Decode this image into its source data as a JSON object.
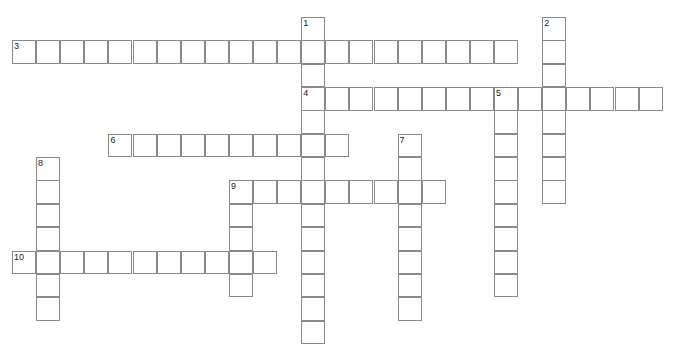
{
  "puzzle": {
    "type": "crossword",
    "cell_w": 24.1,
    "cell_h": 23.35,
    "origin_x": 12,
    "origin_y": 17,
    "line_color": "#8a8a8a",
    "words": [
      {
        "number": "1",
        "direction": "down",
        "row": 0,
        "col": 12,
        "length": 14
      },
      {
        "number": "2",
        "direction": "down",
        "row": 0,
        "col": 22,
        "length": 8
      },
      {
        "number": "3",
        "direction": "across",
        "row": 1,
        "col": 0,
        "length": 21
      },
      {
        "number": "4",
        "direction": "across",
        "row": 3,
        "col": 12,
        "length": 15
      },
      {
        "number": "5",
        "direction": "down",
        "row": 3,
        "col": 20,
        "length": 9
      },
      {
        "number": "6",
        "direction": "across",
        "row": 5,
        "col": 4,
        "length": 10
      },
      {
        "number": "7",
        "direction": "down",
        "row": 5,
        "col": 16,
        "length": 8
      },
      {
        "number": "8",
        "direction": "down",
        "row": 6,
        "col": 1,
        "length": 7
      },
      {
        "number": "9",
        "direction": "across",
        "row": 7,
        "col": 9,
        "length": 9
      },
      {
        "number": "9",
        "direction": "down",
        "row": 7,
        "col": 9,
        "length": 5
      },
      {
        "number": "10",
        "direction": "across",
        "row": 10,
        "col": 0,
        "length": 11
      }
    ]
  }
}
